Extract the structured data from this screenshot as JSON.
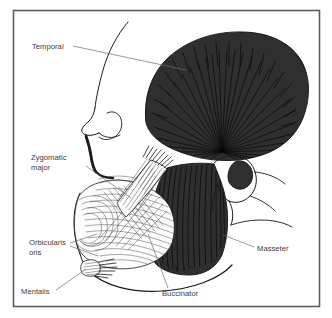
{
  "figure": {
    "background_color": "#ffffff",
    "frame_color": "#5b5b60",
    "label_color": "#3a3a3a",
    "leader_color": "#6d6d6d",
    "dark_muscle_color": "#2f2f2f",
    "light_muscle_color": "#fdfdfd",
    "outline_color": "#1a1a1a"
  },
  "labels": [
    {
      "id": "temporal",
      "text": "Temporal",
      "x": 32,
      "y": 49,
      "anchor": "start",
      "lines": [
        "Temporal"
      ],
      "leader_from": [
        73,
        47
      ],
      "leader_to": [
        186,
        70
      ],
      "muscle_shading": "dark",
      "description": "Temporalis muscle, fan-shaped, fills the temporal fossa"
    },
    {
      "id": "zygomatic-major",
      "text": "Zygomatic major",
      "x": 31,
      "y": 160,
      "anchor": "start",
      "lines": [
        "Zygomatic",
        "major"
      ],
      "leader_from": [
        86,
        166
      ],
      "leader_to": [
        131,
        198
      ],
      "muscle_shading": "light",
      "description": "Zygomaticus major, diagonal strap to the angle of the mouth"
    },
    {
      "id": "orbicularis-oris",
      "text": "Orbicularis oris",
      "x": 29,
      "y": 245,
      "anchor": "start",
      "lines": [
        "Orbicularis",
        "oris"
      ],
      "leader_from": [
        70,
        244
      ],
      "leader_to": [
        96,
        236
      ],
      "leader_from_2": [
        70,
        247
      ],
      "leader_to_2": [
        97,
        256
      ],
      "muscle_shading": "light",
      "description": "Orbicularis oris, sphincter encircling the mouth"
    },
    {
      "id": "mentalis",
      "text": "Mentalis",
      "x": 21,
      "y": 294,
      "anchor": "start",
      "lines": [
        "Mentalis"
      ],
      "leader_from": [
        56,
        291
      ],
      "leader_to": [
        85,
        270
      ],
      "muscle_shading": "light",
      "description": "Mentalis, small muscle of the chin"
    },
    {
      "id": "buccinator",
      "text": "Buccinator",
      "x": 162,
      "y": 296,
      "anchor": "start",
      "lines": [
        "Buccinator"
      ],
      "leader_from": [
        166,
        288
      ],
      "leader_to": [
        147,
        235
      ],
      "muscle_shading": "light",
      "description": "Buccinator, deep cheek muscle"
    },
    {
      "id": "masseter",
      "text": "Masseter",
      "x": 257,
      "y": 251,
      "anchor": "start",
      "lines": [
        "Masseter"
      ],
      "leader_from": [
        254,
        248
      ],
      "leader_to": [
        224,
        236
      ],
      "muscle_shading": "dark",
      "description": "Masseter, quadrilateral muscle over the ramus of the mandible"
    }
  ],
  "frame": {
    "x": 13,
    "y": 10,
    "width": 307,
    "height": 297
  }
}
